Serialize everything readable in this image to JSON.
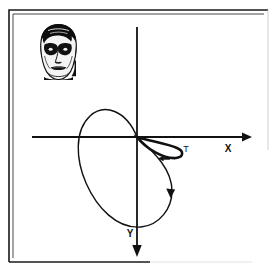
{
  "figure": {
    "name": "trajectory-phase-plot-with-face-icon",
    "background_color": "#ffffff",
    "stroke_color": "#111111",
    "border": {
      "name": "outer-frame",
      "style": "thin double rule, open at lower-right",
      "color": "#1a1a1a",
      "left_x": 9,
      "top_y": 9,
      "right_x": 268,
      "bottom_y": 262
    },
    "axes": {
      "origin": {
        "x": 137,
        "y": 137
      },
      "x_axis": {
        "label": "X",
        "label_x": 228,
        "label_y": 148,
        "start_x": 32,
        "end_x": 252,
        "y": 137,
        "arrow": "right"
      },
      "y_axis": {
        "label": "Y",
        "label_x": 130,
        "label_y": 234,
        "start_y": 27,
        "end_y": 257,
        "x": 137,
        "arrow": "down"
      }
    },
    "curve": {
      "name": "closed-trajectory-curve",
      "description": "large teardrop loop through origin with small secondary loop in the fourth quadrant near origin",
      "stroke_width_main": 1.4,
      "stroke_width_small_loop": 2.6,
      "path_main": "M 137 137 C 126 110 104 103 90 116 C 74 131 76 160 86 183 C 97 208 117 229 141 227 C 160 225 172 208 172 191 C 172 170 156 154 137 137 Z",
      "path_small_loop": "M 137 137 C 150 141 168 144 177 148 C 184 151 184 157 176 158 C 164 159 146 149 137 137 Z",
      "arrow_large": {
        "name": "direction-arrow-large",
        "x": 170,
        "y": 194,
        "direction": "down"
      },
      "arrow_small": {
        "name": "direction-arrow-small",
        "x": 163,
        "y": 158,
        "direction": "left"
      }
    },
    "point_label": {
      "text": "T",
      "x": 186,
      "y": 149
    },
    "face_icon": {
      "name": "face-portrait-icon",
      "description": "high contrast black and white frontal portrait of a man",
      "left": 38,
      "top": 24,
      "width": 41,
      "height": 56
    }
  }
}
